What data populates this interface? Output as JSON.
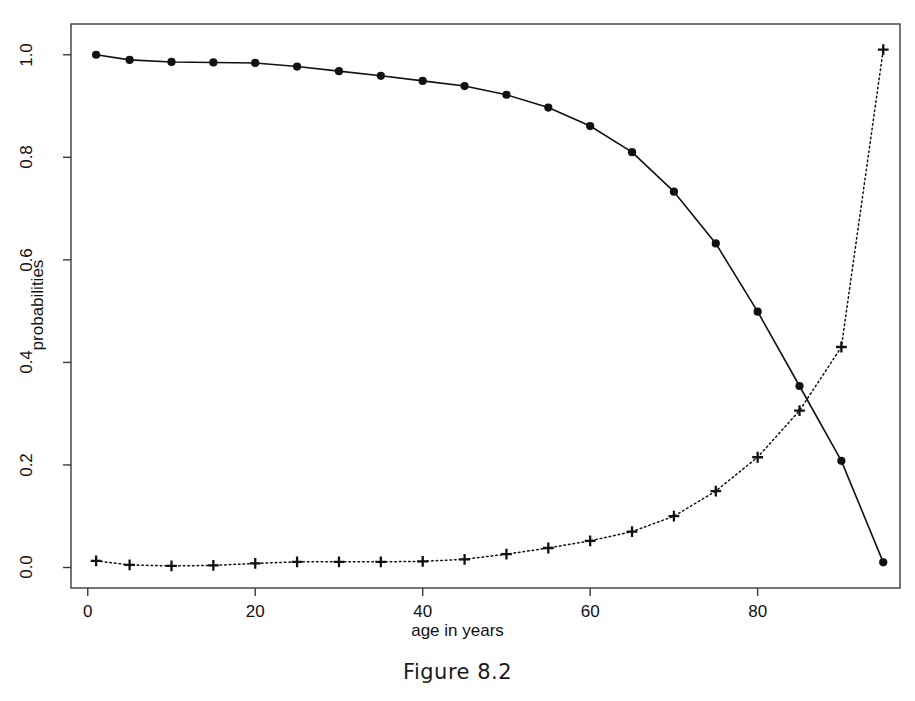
{
  "figure": {
    "caption": "Figure 8.2"
  },
  "chart_data": {
    "type": "line",
    "title": "",
    "xlabel": "age in years",
    "ylabel": "probabilities",
    "xlim": [
      -2,
      97
    ],
    "ylim": [
      -0.04,
      1.06
    ],
    "grid": false,
    "legend": "none",
    "xticks": [
      0,
      20,
      40,
      60,
      80
    ],
    "xtick_labels": [
      "0",
      "20",
      "40",
      "60",
      "80"
    ],
    "yticks": [
      0.0,
      0.2,
      0.4,
      0.6,
      0.8,
      1.0
    ],
    "ytick_labels": [
      "0.0",
      "0.2",
      "0.4",
      "0.6",
      "0.8",
      "1.0"
    ],
    "x": [
      1,
      5,
      10,
      15,
      20,
      25,
      30,
      35,
      40,
      45,
      50,
      55,
      60,
      65,
      70,
      75,
      80,
      85,
      90,
      95
    ],
    "series": [
      {
        "name": "survival probability",
        "marker": "filled-circle",
        "linestyle": "solid",
        "color": "#111111",
        "values": [
          1.0,
          0.99,
          0.986,
          0.985,
          0.984,
          0.977,
          0.968,
          0.959,
          0.949,
          0.939,
          0.922,
          0.897,
          0.861,
          0.81,
          0.733,
          0.632,
          0.499,
          0.354,
          0.208,
          0.01
        ]
      },
      {
        "name": "death probability",
        "marker": "plus",
        "linestyle": "dotted",
        "color": "#111111",
        "values": [
          0.013,
          0.005,
          0.003,
          0.004,
          0.008,
          0.011,
          0.011,
          0.011,
          0.012,
          0.016,
          0.026,
          0.038,
          0.052,
          0.07,
          0.1,
          0.149,
          0.215,
          0.306,
          0.43,
          1.01
        ]
      }
    ]
  }
}
